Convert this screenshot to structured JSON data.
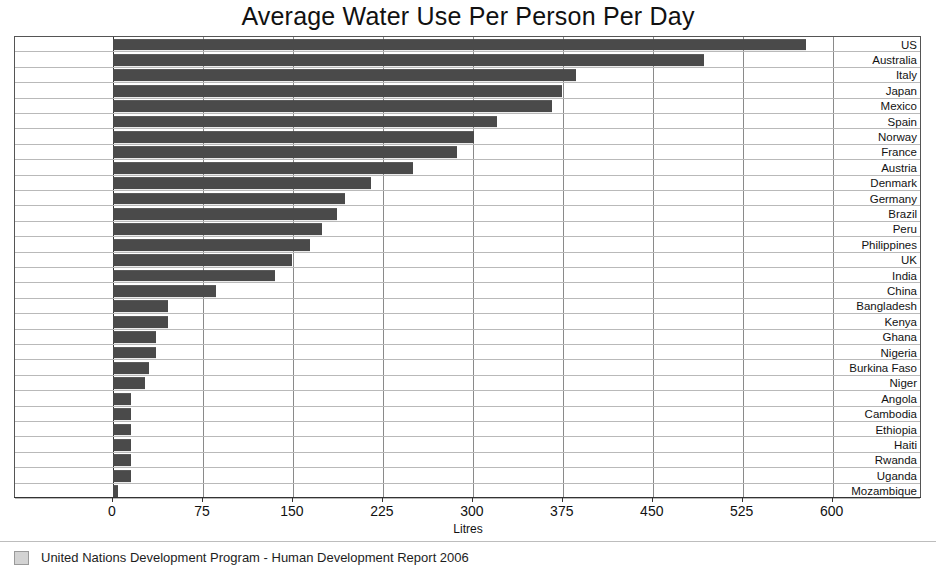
{
  "chart_data": {
    "type": "bar",
    "orientation": "horizontal",
    "title": "Average Water Use Per Person Per Day",
    "xlabel": "Litres",
    "ylabel": "",
    "xlim": [
      0,
      674
    ],
    "xticks": [
      0,
      75,
      150,
      225,
      300,
      375,
      450,
      525,
      600
    ],
    "xtick_labels": [
      "0",
      "75",
      "150",
      "225",
      "300",
      "375",
      "450",
      "525",
      "600"
    ],
    "grid": true,
    "legend_position": "bottom-left",
    "legend": [
      "United Nations Development Program - Human Development Report 2006"
    ],
    "bar_color": "#4a4a4a",
    "categories": [
      "US",
      "Australia",
      "Italy",
      "Japan",
      "Mexico",
      "Spain",
      "Norway",
      "France",
      "Austria",
      "Denmark",
      "Germany",
      "Brazil",
      "Peru",
      "Philippines",
      "UK",
      "India",
      "China",
      "Bangladesh",
      "Kenya",
      "Ghana",
      "Nigeria",
      "Burkina Faso",
      "Niger",
      "Angola",
      "Cambodia",
      "Ethiopia",
      "Haiti",
      "Rwanda",
      "Uganda",
      "Mozambique"
    ],
    "values": [
      578,
      493,
      386,
      374,
      366,
      320,
      301,
      287,
      250,
      215,
      193,
      187,
      174,
      164,
      149,
      135,
      86,
      46,
      46,
      36,
      36,
      30,
      27,
      15,
      15,
      15,
      15,
      15,
      15,
      4
    ]
  },
  "axis": {
    "x_title": "Litres"
  },
  "legend": {
    "source_label": "United Nations Development Program - Human Development Report 2006"
  }
}
